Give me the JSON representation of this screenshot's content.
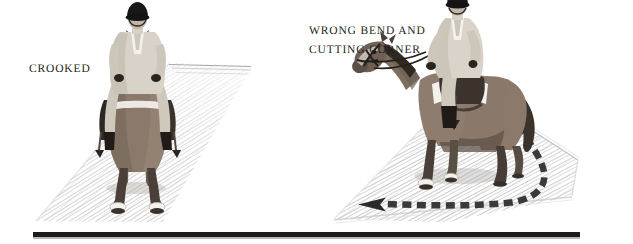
{
  "page": {
    "width": 633,
    "height": 244,
    "background_color": "#ffffff",
    "ink_color": "#231f20",
    "rule_color": "#1c1c1c"
  },
  "panels": [
    {
      "id": "crooked",
      "caption": "CROOKED",
      "caption_lines": [
        "CROOKED"
      ],
      "subject": "horse-and-rider-front-view",
      "ground": "hatched-perspective-arena",
      "has_arrow": false
    },
    {
      "id": "wrong-bend",
      "caption": "WRONG BEND AND CUTTING CORNER",
      "caption_lines": [
        "WRONG BEND AND",
        "CUTTING CORNER"
      ],
      "subject": "horse-and-rider-three-quarter-view",
      "ground": "hatched-perspective-arena",
      "has_arrow": true,
      "arrow": {
        "style": "dashed",
        "head": "solid-triangle",
        "direction": "left",
        "description": "dashed track curving from upper right around a cut corner then straight to the left"
      }
    }
  ],
  "figure": {
    "rider_helmet_color": "#1a1a1a",
    "rider_jacket_color": "#d8d2c8",
    "horse_body_color": "#8a7a6c",
    "horse_shadow_color": "#3b332c",
    "arena_hatch_color": "#b7b7b7",
    "arrow_color": "#3a3a3a"
  }
}
